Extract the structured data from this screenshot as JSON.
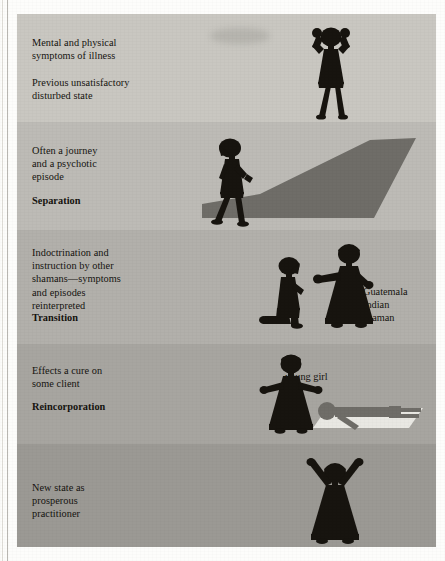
{
  "figure": {
    "title_absent": true,
    "bands": [
      {
        "id": "band-illness",
        "text": "Mental and physical\nsymptoms of illness\n\nPrevious unsatisfactory\ndisturbed state",
        "stage_label": "",
        "bg": "#c9c7c1",
        "top": 0,
        "height": 108,
        "figures": [
          "hands-on-head-figure"
        ]
      },
      {
        "id": "band-separation",
        "text": "Often a journey\nand a psychotic\nepisode",
        "stage_label": "Separation",
        "bg": "#bdbbb6",
        "top": 108,
        "height": 108,
        "figures": [
          "walking-figure",
          "long-shadow"
        ]
      },
      {
        "id": "band-transition",
        "text": "Indoctrination and\ninstruction by other\nshamans—symptoms\nand episodes\nreinterpreted",
        "stage_label": "Transition",
        "bg": "#b2b0ab",
        "top": 216,
        "height": 114,
        "figures": [
          "kneeling-novice-figure",
          "guatemala-shaman-figure"
        ],
        "annotation": "Guatemala\nIndian\nshaman"
      },
      {
        "id": "band-reincorporation",
        "text": "Effects a cure on\nsome client",
        "stage_label": "Reincorporation",
        "bg": "#a7a5a0",
        "top": 330,
        "height": 100,
        "figures": [
          "healer-figure",
          "reclining-patient-figure",
          "mat"
        ],
        "annotation": "young girl"
      },
      {
        "id": "band-new-state",
        "text": "New state as\nprosperous\npractitioner",
        "stage_label": "",
        "bg": "#9b9994",
        "top": 430,
        "height": 103,
        "figures": [
          "arms-raised-figure"
        ]
      }
    ],
    "colors": {
      "silhouette": "#17140f",
      "shadow": "#6f6d68",
      "patient": "#6f6d68",
      "mat": "#e9e8e3",
      "text": "#15130f",
      "page": "#fdfdfb"
    }
  }
}
